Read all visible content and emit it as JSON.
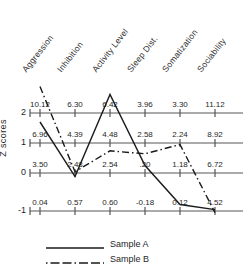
{
  "chart_data": {
    "type": "line",
    "title": "",
    "xlabel": "",
    "ylabel": "Z scores",
    "ylim": [
      -1.6,
      2.9
    ],
    "grid": false,
    "legend_position": "bottom-left",
    "categories": [
      "Aggression",
      "Inhibition",
      "Activity Level",
      "Sleep Dist.",
      "Somatization",
      "Sociability"
    ],
    "y_ticks": [
      "2",
      "1",
      "0",
      "-1"
    ],
    "y_tick_values": [
      2,
      1,
      0,
      -1
    ],
    "series": [
      {
        "name": "Sample A",
        "style": "solid",
        "values": [
          1.7,
          -0.12,
          2.62,
          0.25,
          -1.05,
          -1.22
        ]
      },
      {
        "name": "Sample B",
        "style": "dash-dot",
        "values": [
          2.88,
          0.04,
          0.74,
          0.64,
          0.95,
          -1.32
        ]
      }
    ],
    "annotation_rows": [
      {
        "at_tick": "2",
        "values": [
          "10.12",
          "6.30",
          "6.42",
          "3.96",
          "3.30",
          "11.12"
        ]
      },
      {
        "at_tick": "1",
        "values": [
          "6.96",
          "4.39",
          "4.48",
          "2.58",
          "2.24",
          "8.92"
        ]
      },
      {
        "at_tick": "0",
        "values": [
          "3.50",
          "2.48",
          "2.54",
          ".20",
          "1.18",
          "6.72"
        ]
      },
      {
        "at_tick": "-1",
        "values": [
          "0.04",
          "0.57",
          "0.60",
          "-0.18",
          "0.12",
          "4.52"
        ]
      }
    ]
  },
  "legend": {
    "items": [
      {
        "label": "Sample A"
      },
      {
        "label": "Sample B"
      }
    ]
  },
  "axis": {
    "y_title": "Z scores"
  },
  "colors": {
    "axis_line": "#8e8e8e",
    "series_a": "#1a1a1a",
    "series_b": "#1a1a1a",
    "text": "#1f1f1f"
  }
}
